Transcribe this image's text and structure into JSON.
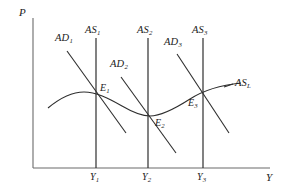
{
  "figure": {
    "type": "economics-diagram",
    "axes": {
      "y_label": "P",
      "x_label": "Y",
      "origin_px": [
        33,
        168
      ],
      "y_axis_top_px": 18,
      "x_axis_right_px": 270
    },
    "colors": {
      "axis": "#6b6b6b",
      "curve": "#2e2e2e",
      "text": "#1c1c1c",
      "background": "#ffffff"
    }
  },
  "curves": {
    "vertical_supply": [
      {
        "label": "AS",
        "sub": "1",
        "x_px": 96,
        "top_px": 38,
        "bottom_px": 168
      },
      {
        "label": "AS",
        "sub": "2",
        "x_px": 148,
        "top_px": 38,
        "bottom_px": 168
      },
      {
        "label": "AS",
        "sub": "3",
        "x_px": 203,
        "top_px": 38,
        "bottom_px": 168
      }
    ],
    "demand_lines": [
      {
        "label": "AD",
        "sub": "1",
        "x1_px": 67,
        "y1_px": 51,
        "x2_px": 126,
        "y2_px": 133
      },
      {
        "label": "AD",
        "sub": "2",
        "x1_px": 121,
        "y1_px": 77,
        "x2_px": 176,
        "y2_px": 153
      },
      {
        "label": "AD",
        "sub": "3",
        "x1_px": 177,
        "y1_px": 54,
        "x2_px": 229,
        "y2_px": 133
      }
    ],
    "long_run_supply": {
      "label": "AS",
      "sub": "L"
    }
  },
  "equilibria": [
    {
      "label": "E",
      "sub": "1",
      "x_px": 96,
      "y_px": 94
    },
    {
      "label": "E",
      "sub": "2",
      "x_px": 148,
      "y_px": 115
    },
    {
      "label": "E",
      "sub": "3",
      "x_px": 203,
      "y_px": 93
    }
  ],
  "x_ticks": [
    {
      "label": "Y",
      "sub": "1",
      "x_px": 96
    },
    {
      "label": "Y",
      "sub": "2",
      "x_px": 148
    },
    {
      "label": "Y",
      "sub": "3",
      "x_px": 203
    }
  ],
  "labels": {
    "p_axis": "P",
    "y_axis": "Y",
    "ad1": "AD",
    "ad1_sub": "1",
    "ad2": "AD",
    "ad2_sub": "2",
    "ad3": "AD",
    "ad3_sub": "3",
    "as1": "AS",
    "as1_sub": "1",
    "as2": "AS",
    "as2_sub": "2",
    "as3": "AS",
    "as3_sub": "3",
    "asl": "AS",
    "asl_sub": "L",
    "e1": "E",
    "e1_sub": "1",
    "e2": "E",
    "e2_sub": "2",
    "e3": "E",
    "e3_sub": "3",
    "y1": "Y",
    "y1_sub": "1",
    "y2": "Y",
    "y2_sub": "2",
    "y3": "Y",
    "y3_sub": "3"
  }
}
